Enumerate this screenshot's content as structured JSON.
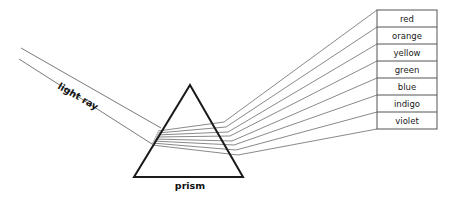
{
  "diagram": {
    "labels": {
      "light_ray": "light ray",
      "prism": "prism"
    },
    "spectrum": {
      "colors": [
        "red",
        "orange",
        "yellow",
        "green",
        "blue",
        "indigo",
        "violet"
      ]
    },
    "colors": {
      "stroke_dark": "#1a1a1a",
      "stroke_light": "#6b6b6b",
      "stroke_table": "#555555",
      "background": "#ffffff",
      "text": "#111111"
    },
    "geometry": {
      "prism_apex": [
        190,
        85
      ],
      "prism_base_left": [
        134,
        177
      ],
      "prism_base_right": [
        243,
        177
      ],
      "incoming_ray_top_start": [
        21,
        48
      ],
      "incoming_ray_bottom_start": [
        19,
        59
      ],
      "entry_point_top": [
        161,
        128
      ],
      "entry_point_bottom": [
        152,
        144
      ],
      "table_left": 377,
      "table_top": 10,
      "table_right": 437,
      "table_bottom": 129,
      "row_count": 7
    }
  }
}
